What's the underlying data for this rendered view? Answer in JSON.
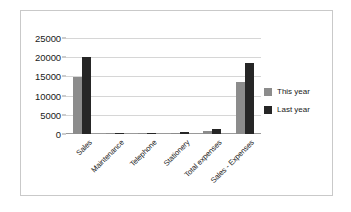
{
  "chart_data": {
    "type": "bar",
    "title": "",
    "xlabel": "",
    "ylabel": "",
    "ylim": [
      0,
      25000
    ],
    "ytick_values": [
      0,
      5000,
      10000,
      15000,
      20000,
      25000
    ],
    "ytick_labels": [
      "0",
      "5000",
      "10000",
      "15000",
      "20000",
      "25000"
    ],
    "grid": true,
    "legend_position": "right",
    "categories": [
      "Sales",
      "Maintenance",
      "Telephone",
      "Stationery",
      "Total expenses",
      "Sales - Expenses"
    ],
    "series": [
      {
        "name": "This year",
        "color": "#8c8c8c",
        "values": [
          14800,
          250,
          200,
          300,
          850,
          13600
        ]
      },
      {
        "name": "Last year",
        "color": "#262626",
        "values": [
          20000,
          350,
          320,
          500,
          1400,
          18600
        ]
      }
    ]
  },
  "legend": {
    "items": [
      {
        "label": "This year"
      },
      {
        "label": "Last year"
      }
    ]
  },
  "colors": {
    "this_year": "#8c8c8c",
    "last_year": "#262626",
    "grid": "#d6d6d6",
    "axis": "#9a9a9a",
    "frame": "#c9c9c9",
    "text": "#1a1a1a"
  }
}
